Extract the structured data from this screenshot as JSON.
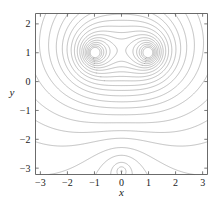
{
  "chart_data": {
    "type": "line",
    "subtype": "contour",
    "title": "",
    "subtitle": "",
    "xlabel": "x",
    "ylabel": "y",
    "xlim": [
      -3.18,
      3.18
    ],
    "ylim": [
      -3.22,
      2.36
    ],
    "xticks": [
      -3,
      -2,
      -1,
      0,
      1,
      2,
      3
    ],
    "xticklabels": [
      "-3",
      "-2",
      "-1",
      "0",
      "1",
      "2",
      "3"
    ],
    "yticks": [
      -3,
      -2,
      -1,
      0,
      1,
      2
    ],
    "yticklabels": [
      "-3",
      "-2",
      "-1",
      "0",
      "1",
      "2"
    ],
    "grid": false,
    "legend": "none",
    "line_color": "#8d8d8d",
    "frame_color": "#5a5a5a",
    "text_color": "#1a1a1a",
    "background": "#ffffff",
    "maxima": [
      {
        "x": -1,
        "y": 1
      },
      {
        "x": 1,
        "y": 1
      }
    ],
    "saddle": {
      "x": 0,
      "y": 1
    },
    "cusp": {
      "x": 0,
      "y": -3.1
    },
    "level_count": 26,
    "levels": [
      -2.6,
      -2.3,
      -2.0,
      -1.75,
      -1.5,
      -1.3,
      -1.1,
      -0.95,
      -0.8,
      -0.65,
      -0.52,
      -0.4,
      -0.28,
      -0.17,
      -0.07,
      0.03,
      0.12,
      0.21,
      0.3,
      0.38,
      0.46,
      0.54,
      0.62,
      0.7,
      0.78,
      0.86
    ]
  },
  "axes": {
    "x_axis_label": "x",
    "y_axis_label": "y"
  }
}
